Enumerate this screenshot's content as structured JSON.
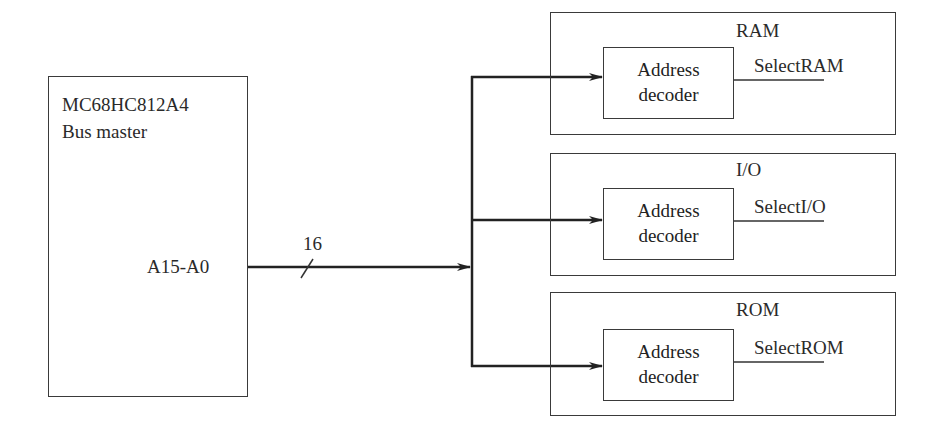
{
  "master": {
    "title": "MC68HC812A4",
    "subtitle": "Bus master",
    "port_label": "A15-A0"
  },
  "bus": {
    "width_label": "16"
  },
  "devices": [
    {
      "name": "RAM",
      "decoder_line1": "Address",
      "decoder_line2": "decoder",
      "select_signal": "SelectRAM"
    },
    {
      "name": "I/O",
      "decoder_line1": "Address",
      "decoder_line2": "decoder",
      "select_signal": "SelectI/O"
    },
    {
      "name": "ROM",
      "decoder_line1": "Address",
      "decoder_line2": "decoder",
      "select_signal": "SelectROM"
    }
  ],
  "colors": {
    "line": "#2a2a2a",
    "background": "#ffffff"
  }
}
